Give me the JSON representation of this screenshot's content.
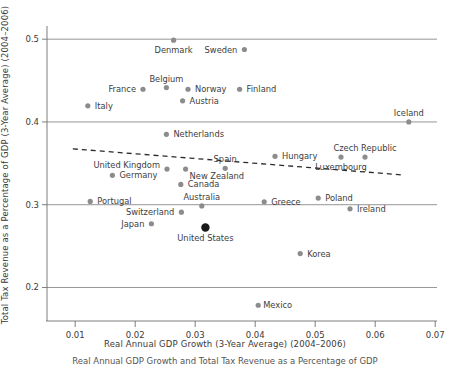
{
  "chart_data": {
    "type": "scatter",
    "title": "",
    "xlabel": "Real Annual GDP Growth (3-Year Average) (2004–2006)",
    "ylabel": "Total Tax Revenue as a Percentage of GDP (3-Year Average) (2004–2006)",
    "caption": "Real Annual GDP Growth and Total Tax Revenue as a Percentage of GDP",
    "xlim": [
      0.0053,
      0.0703
    ],
    "ylim": [
      0.1595,
      0.5135
    ],
    "xticks": [
      0.01,
      0.02,
      0.03,
      0.04,
      0.05,
      0.06,
      0.07
    ],
    "xtick_labels": [
      "0.01",
      "0.02",
      "0.03",
      "0.04",
      "0.05",
      "0.06",
      "0.07"
    ],
    "yticks": [
      0.2,
      0.3,
      0.4,
      0.5
    ],
    "ytick_labels": [
      "0.2",
      "0.3",
      "0.4",
      "0.5"
    ],
    "grid": "horizontal",
    "legend": "none",
    "marker_color": "#8c8c8c",
    "highlight_color": "#1a1a1a",
    "trendline": {
      "label": "linear fit (dashed)",
      "x": [
        0.0096,
        0.0649
      ],
      "y": [
        0.3675,
        0.3358
      ],
      "style": "dashed"
    },
    "points": [
      {
        "name": "Denmark",
        "x": 0.0264,
        "y": 0.4988,
        "label_dx": 0,
        "label_dy": 13,
        "anchor": "middle",
        "highlight": false
      },
      {
        "name": "Sweden",
        "x": 0.0382,
        "y": 0.4875,
        "label_dx": -7,
        "label_dy": 3,
        "anchor": "end",
        "highlight": false
      },
      {
        "name": "Belgium",
        "x": 0.0252,
        "y": 0.4415,
        "label_dx": 0,
        "label_dy": -6,
        "anchor": "middle",
        "highlight": false
      },
      {
        "name": "France",
        "x": 0.0213,
        "y": 0.4395,
        "label_dx": -7,
        "label_dy": 3,
        "anchor": "end",
        "highlight": false
      },
      {
        "name": "Norway",
        "x": 0.0288,
        "y": 0.4395,
        "label_dx": 7,
        "label_dy": 3,
        "anchor": "start",
        "highlight": false
      },
      {
        "name": "Finland",
        "x": 0.0374,
        "y": 0.4395,
        "label_dx": 7,
        "label_dy": 3,
        "anchor": "start",
        "highlight": false
      },
      {
        "name": "Austria",
        "x": 0.0279,
        "y": 0.4255,
        "label_dx": 7,
        "label_dy": 3,
        "anchor": "start",
        "highlight": false
      },
      {
        "name": "Italy",
        "x": 0.0121,
        "y": 0.4195,
        "label_dx": 7,
        "label_dy": 3,
        "anchor": "start",
        "highlight": false
      },
      {
        "name": "Iceland",
        "x": 0.0656,
        "y": 0.4,
        "label_dx": 0,
        "label_dy": -6,
        "anchor": "middle",
        "highlight": false
      },
      {
        "name": "Netherlands",
        "x": 0.0252,
        "y": 0.385,
        "label_dx": 7,
        "label_dy": 3,
        "anchor": "start",
        "highlight": false
      },
      {
        "name": "Hungary",
        "x": 0.0433,
        "y": 0.3585,
        "label_dx": 7,
        "label_dy": 3,
        "anchor": "start",
        "highlight": false
      },
      {
        "name": "Czech Republic",
        "x": 0.0583,
        "y": 0.3575,
        "label_dx": 0,
        "label_dy": -6,
        "anchor": "middle",
        "highlight": false
      },
      {
        "name": "Luxembourg",
        "x": 0.0543,
        "y": 0.3575,
        "label_dx": 0,
        "label_dy": 13,
        "anchor": "middle",
        "highlight": false
      },
      {
        "name": "United Kingdom",
        "x": 0.0253,
        "y": 0.343,
        "label_dx": -7,
        "label_dy": -1,
        "anchor": "end",
        "highlight": false
      },
      {
        "name": "New Zealand",
        "x": 0.0284,
        "y": 0.343,
        "label_dx": 4,
        "label_dy": 10,
        "anchor": "start",
        "highlight": false
      },
      {
        "name": "Spain",
        "x": 0.035,
        "y": 0.344,
        "label_dx": 0,
        "label_dy": -6,
        "anchor": "middle",
        "highlight": false
      },
      {
        "name": "Germany",
        "x": 0.0162,
        "y": 0.3355,
        "label_dx": 7,
        "label_dy": 3,
        "anchor": "start",
        "highlight": false
      },
      {
        "name": "Canada",
        "x": 0.0276,
        "y": 0.3245,
        "label_dx": 7,
        "label_dy": 3,
        "anchor": "start",
        "highlight": false
      },
      {
        "name": "Poland",
        "x": 0.0505,
        "y": 0.308,
        "label_dx": 7,
        "label_dy": 3,
        "anchor": "start",
        "highlight": false
      },
      {
        "name": "Portugal",
        "x": 0.0125,
        "y": 0.304,
        "label_dx": 7,
        "label_dy": 3,
        "anchor": "start",
        "highlight": false
      },
      {
        "name": "Greece",
        "x": 0.0415,
        "y": 0.3035,
        "label_dx": 7,
        "label_dy": 3,
        "anchor": "start",
        "highlight": false
      },
      {
        "name": "Australia",
        "x": 0.0311,
        "y": 0.2985,
        "label_dx": 0,
        "label_dy": -6,
        "anchor": "middle",
        "highlight": false
      },
      {
        "name": "Ireland",
        "x": 0.0558,
        "y": 0.295,
        "label_dx": 7,
        "label_dy": 3,
        "anchor": "start",
        "highlight": false
      },
      {
        "name": "Switzerland",
        "x": 0.0277,
        "y": 0.291,
        "label_dx": -7,
        "label_dy": 3,
        "anchor": "end",
        "highlight": false
      },
      {
        "name": "Japan",
        "x": 0.0227,
        "y": 0.277,
        "label_dx": -7,
        "label_dy": 3,
        "anchor": "end",
        "highlight": false
      },
      {
        "name": "United States",
        "x": 0.0317,
        "y": 0.2725,
        "label_dx": 0,
        "label_dy": 14,
        "anchor": "middle",
        "highlight": true
      },
      {
        "name": "Korea",
        "x": 0.0475,
        "y": 0.241,
        "label_dx": 7,
        "label_dy": 3,
        "anchor": "start",
        "highlight": false
      },
      {
        "name": "Mexico",
        "x": 0.0405,
        "y": 0.1785,
        "label_dx": 5,
        "label_dy": 3,
        "anchor": "start",
        "highlight": false
      }
    ]
  }
}
